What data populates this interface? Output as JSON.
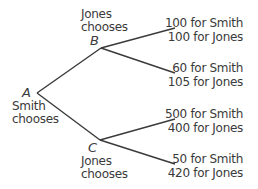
{
  "nodes": {
    "A": {
      "letter": "A",
      "label_line1": "Smith",
      "label_line2": "chooses"
    },
    "B": {
      "letter": "B",
      "label_line1": "Jones",
      "label_line2": "chooses"
    },
    "C": {
      "letter": "C",
      "label_line1": "Jones",
      "label_line2": "chooses"
    }
  },
  "outcomes": [
    {
      "line1": "100 for Smith",
      "line2": "100 for Jones"
    },
    {
      "line1": "60 for Smith",
      "line2": "105 for Jones"
    },
    {
      "line1": "500 for Smith",
      "line2": "400 for Jones"
    },
    {
      "line1": "50 for Smith",
      "line2": "420 for Jones"
    }
  ],
  "colors": {
    "line": "#3a3a3a",
    "text": "#3a3a3a"
  }
}
